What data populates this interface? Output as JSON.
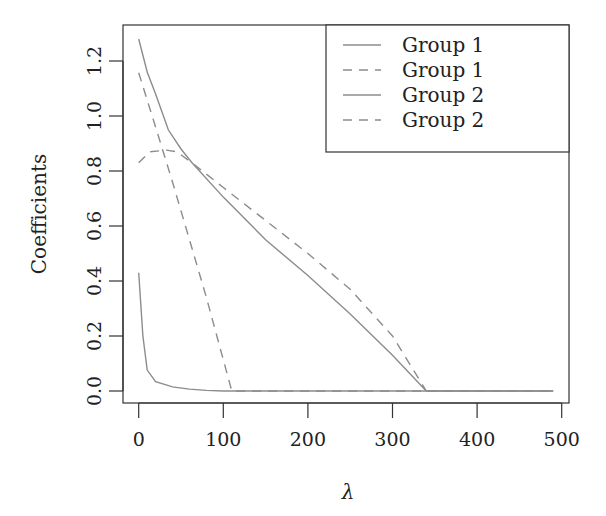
{
  "chart_data": {
    "type": "line",
    "title": "",
    "xlabel": "λ",
    "ylabel": "Coefficients",
    "xlim": [
      -10,
      508
    ],
    "ylim": [
      -0.04,
      1.33
    ],
    "x_ticks": [
      0,
      100,
      200,
      300,
      400,
      500
    ],
    "x_tick_labels": [
      "0",
      "100",
      "200",
      "300",
      "400",
      "500"
    ],
    "y_ticks": [
      0.0,
      0.2,
      0.4,
      0.6,
      0.8,
      1.0,
      1.2
    ],
    "y_tick_labels": [
      "0.0",
      "0.2",
      "0.4",
      "0.6",
      "0.8",
      "1.0",
      "1.2"
    ],
    "grid": false,
    "legend_position": "top-right",
    "series": [
      {
        "name": "Group 1",
        "style": "solid",
        "color": "#8c8c8c",
        "points": [
          [
            0,
            1.28
          ],
          [
            10,
            1.16
          ],
          [
            20,
            1.08
          ],
          [
            35,
            0.95
          ],
          [
            50,
            0.88
          ],
          [
            63,
            0.83
          ],
          [
            100,
            0.705
          ],
          [
            150,
            0.55
          ],
          [
            200,
            0.42
          ],
          [
            250,
            0.28
          ],
          [
            300,
            0.13
          ],
          [
            340,
            0.0
          ],
          [
            490,
            0.0
          ]
        ]
      },
      {
        "name": "Group 1",
        "style": "dashed",
        "color": "#8c8c8c",
        "points": [
          [
            0,
            1.157
          ],
          [
            20,
            0.96
          ],
          [
            40,
            0.76
          ],
          [
            60,
            0.55
          ],
          [
            80,
            0.34
          ],
          [
            95,
            0.17
          ],
          [
            110,
            0.0
          ],
          [
            490,
            0.0
          ]
        ]
      },
      {
        "name": "Group 2",
        "style": "solid",
        "color": "#8c8c8c",
        "points": [
          [
            0,
            0.43
          ],
          [
            5,
            0.2
          ],
          [
            10,
            0.076
          ],
          [
            20,
            0.034
          ],
          [
            40,
            0.015
          ],
          [
            60,
            0.007
          ],
          [
            80,
            0.002
          ],
          [
            100,
            0.0
          ],
          [
            490,
            0.0
          ]
        ]
      },
      {
        "name": "Group 2",
        "style": "dashed",
        "color": "#8c8c8c",
        "points": [
          [
            0,
            0.83
          ],
          [
            13,
            0.87
          ],
          [
            33,
            0.876
          ],
          [
            45,
            0.87
          ],
          [
            63,
            0.83
          ],
          [
            100,
            0.74
          ],
          [
            150,
            0.62
          ],
          [
            200,
            0.5
          ],
          [
            250,
            0.37
          ],
          [
            300,
            0.2
          ],
          [
            340,
            0.0
          ]
        ]
      }
    ],
    "legend": [
      {
        "label": "Group 1",
        "style": "solid"
      },
      {
        "label": "Group 1",
        "style": "dashed"
      },
      {
        "label": "Group 2",
        "style": "solid"
      },
      {
        "label": "Group 2",
        "style": "dashed"
      }
    ]
  },
  "axis_color": "#333333"
}
